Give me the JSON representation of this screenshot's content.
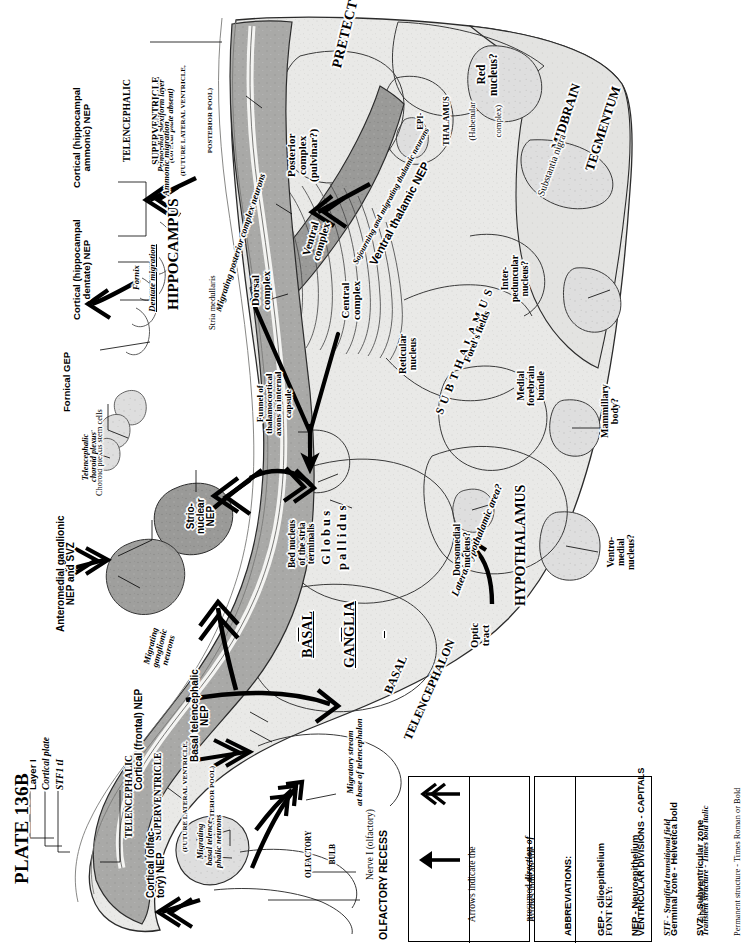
{
  "plate": {
    "title": "PLATE 136B"
  },
  "corner_labels": [
    {
      "name": "layer-i",
      "text": "Layer I",
      "style": "helv"
    },
    {
      "name": "cortical-plate",
      "text": "Cortical plate",
      "style": "ital"
    },
    {
      "name": "stf1-tl",
      "text": "STF1 tI",
      "style": "ital"
    }
  ],
  "ventricular_divisions": [
    {
      "name": "telencephalic-superventricle-posterior",
      "line1": "TELENCEPHALIC",
      "line2": "SUPERVENTRICLE",
      "line3": "(FUTURE LATERAL VENTRICLE,",
      "line4": "POSTERIOR POOL)"
    },
    {
      "name": "telencephalic-superventricle-anterior",
      "line1": "TELENCEPHALIC",
      "line2": "SUPERVENTRICLE",
      "line3": "(FUTURE LATERAL VENTRICLE,",
      "line4": "ANTERIOR POOL)"
    }
  ],
  "regions": {
    "pretectum": "PRETECTUM",
    "midbrain_tegmentum_1": "MIDBRAIN",
    "midbrain_tegmentum_2": "TEGMENTUM",
    "epithalamus_1": "EPI-",
    "epithalamus_2": "THALAMUS",
    "epithalamus_3": "(Habenular",
    "epithalamus_4": "complex)",
    "hippocampus": "HIPPOCAMPUS",
    "subthalamus": "S U B T H A L A M U S",
    "hypothalamus": "HYPOTHALAMUS",
    "basal_ganglia_1": "BASAL",
    "basal_ganglia_2": "GANGLIA",
    "basal_telencephalon_1": "BASAL",
    "basal_telencephalon_2": "TELENCEPHALON",
    "olfactory_recess": "OLFACTORY RECESS",
    "olfactory_bulb_1": "OLFACTORY",
    "olfactory_bulb_2": "BULB"
  },
  "structures": {
    "red_nucleus": "Red\nnucleus?",
    "substantia_nigra": "Substantia nigra",
    "posterior_complex": "Posterior\ncomplex\n(pulvinar?)",
    "dorsal_complex": "Dorsal\ncomplex",
    "ventral_complex": "Ventral\ncomplex",
    "central_complex": "Central\ncomplex",
    "reticular_nucleus": "Reticular\nnucleus",
    "forels_fields": "Forel's fields",
    "interpeduncular_nucleus": "Inter-\npeduncular\nnucleus?",
    "medial_forebrain_bundle": "Medial\nforebrain\nbundle",
    "mammillary_body": "Mammillary\nbody?",
    "lateral_hypothalamic_area": "Lateral hypothalamic area?",
    "dorsomedial_nucleus": "Dorsomedial\nnucleus?",
    "ventromedial_nucleus": "Ventro-\nmedial\nnucleus?",
    "globus_pallidus": "G l o b u s\np a l l i d u s",
    "bed_nucleus_stria_terminalis": "Bed nucleus\nof the stria\nterminalis",
    "optic_tract": "Optic\ntract",
    "fornix": "Fornix",
    "stria_medullaris": "Stria medullaris",
    "nerve_i": "Nerve I (olfactory)"
  },
  "germinal": {
    "cortical_hippocampal_ammonic": "Cortical (hippocampal\nammonic) NEP",
    "cortical_hippocampal_dentate": "Cortical (hippocampal\ndentate) NEP",
    "fornical_gep": "Fornical GEP",
    "ventral_thalamic_nep": "Ventral thalamic NEP",
    "strio_nuclear_nep": "Strio-\nnuclear\nNEP",
    "anteromedial_ganglionic": "Anteromedial ganglionic\nNEP and SVZ",
    "cortical_frontal_nep": "Cortical (frontal) NEP",
    "cortical_olfactory_nep": "Cortical (olfac-\ntory) NEP",
    "basal_telencephalic_nep": "Basal telencephalic\nNEP"
  },
  "transient": {
    "primordial_plexiform": "Primordial plexiform layer\n(cortical plate absent)",
    "ammonic_migration": "Ammonic migration",
    "dentate_migration": "Dentate migration",
    "migrating_posterior_complex": "Migrating posterior complex neurons",
    "sojourning_migrating_thalamic": "Sojourning and migrating thalamic neurons",
    "funnel_thalamocortical": "Funnel of\nthalamocortical\naxons in internal\ncapsule",
    "migrating_ganglionic": "Migrating\nganglionic\nneurons",
    "migrating_basal_telencephalic": "Migrating\nbasal telence-\nphalic neurons",
    "migratory_stream": "Migratory stream\nat base of telencephalon",
    "choroid_plexus_stem_cells": "Choroid plexus stem cells",
    "telencephalic_choroid_plexus": "Telencephalic\nchoroid plexus"
  },
  "legend": {
    "arrow_double": {
      "name": "double-chevron-arrow",
      "line1": "Arrows indicate the",
      "em1": "direction of",
      "pre1": "presumed ",
      "em2": "neuron migration",
      "post2": " from",
      "line3": "neuroepithelial sources."
    },
    "arrow_single": {
      "name": "solid-arrow",
      "line1": "Arrows indicate the",
      "pre1": "presumed ",
      "em1": "direction of",
      "em2": "axon growth",
      "post2": " in brain",
      "line3": "fiber tracts."
    },
    "abbreviations": {
      "heading": "ABBREVIATIONS:",
      "items": [
        {
          "text": "GEP - Glioepithelium",
          "style": "helv"
        },
        {
          "text": "NEP - Neuroepithelium",
          "style": "helv"
        },
        {
          "text": "STF - Stratified transitional field",
          "style": "ital"
        },
        {
          "text": "SVZ - Subventricular zone",
          "style": "helv"
        }
      ]
    },
    "font_key": {
      "heading": "FONT KEY:",
      "items": [
        {
          "text": "VENTRICULAR DIVISIONS - CAPITALS",
          "style": "helv"
        },
        {
          "text": "Germinal zone - Helvetica bold",
          "style": "helv"
        },
        {
          "text": "Transient structure - Times bold italic",
          "style": "ital"
        },
        {
          "text": "Permanent structure - Times Roman or Bold",
          "style": "ser"
        }
      ]
    }
  }
}
